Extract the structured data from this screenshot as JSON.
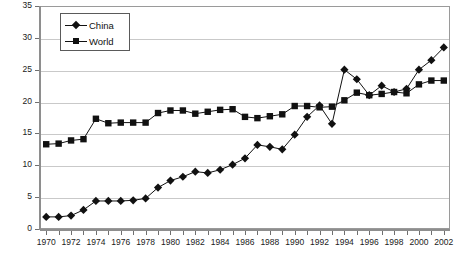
{
  "chart_data": {
    "type": "line",
    "title": "",
    "xlabel": "",
    "ylabel": "",
    "xlim": [
      1969.5,
      2002.5
    ],
    "ylim": [
      0,
      35
    ],
    "yticks": [
      0,
      5,
      10,
      15,
      20,
      25,
      30,
      35
    ],
    "xticks": [
      1970,
      1972,
      1974,
      1976,
      1978,
      1980,
      1982,
      1984,
      1986,
      1988,
      1990,
      1992,
      1994,
      1996,
      1998,
      2000,
      2002
    ],
    "x": [
      1970,
      1971,
      1972,
      1973,
      1974,
      1975,
      1976,
      1977,
      1978,
      1979,
      1980,
      1981,
      1982,
      1983,
      1984,
      1985,
      1986,
      1987,
      1988,
      1989,
      1990,
      1991,
      1992,
      1993,
      1994,
      1995,
      1996,
      1997,
      1998,
      1999,
      2000,
      2001,
      2002
    ],
    "grid": true,
    "legend_position": "top-left",
    "series": [
      {
        "name": "China",
        "marker": "diamond",
        "color": "#111111",
        "values": [
          1.9,
          1.9,
          2.1,
          3.0,
          4.4,
          4.4,
          4.4,
          4.5,
          4.8,
          6.5,
          7.6,
          8.2,
          9.0,
          8.8,
          9.3,
          10.1,
          11.1,
          13.2,
          12.9,
          12.5,
          14.8,
          17.6,
          19.4,
          16.5,
          25.0,
          23.5,
          21.0,
          22.5,
          21.5,
          22.0,
          25.0,
          26.5,
          28.5
        ]
      },
      {
        "name": "World",
        "marker": "square",
        "color": "#111111",
        "values": [
          13.3,
          13.4,
          13.9,
          14.1,
          17.3,
          16.6,
          16.7,
          16.7,
          16.7,
          18.2,
          18.6,
          18.6,
          18.1,
          18.4,
          18.7,
          18.8,
          17.6,
          17.4,
          17.7,
          18.0,
          19.3,
          19.3,
          19.1,
          19.2,
          20.2,
          21.4,
          21.0,
          21.2,
          21.5,
          21.3,
          22.7,
          23.3,
          23.3
        ]
      }
    ]
  },
  "legend": {
    "items": [
      {
        "label": "China",
        "marker": "diamond"
      },
      {
        "label": "World",
        "marker": "square"
      }
    ]
  }
}
